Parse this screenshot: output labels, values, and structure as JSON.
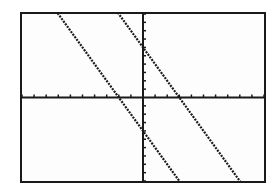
{
  "chart_data": {
    "type": "line",
    "title": "",
    "xlabel": "",
    "ylabel": "",
    "xlim": [
      -10,
      10
    ],
    "ylim": [
      -10,
      10
    ],
    "xscale_tick": 1,
    "yscale_tick": 1,
    "grid": false,
    "axes_visible": true,
    "series": [
      {
        "name": "Y1",
        "equation": "y = -2x + 6",
        "slope": -2,
        "intercept": 6,
        "color": "#1a1a1a"
      },
      {
        "name": "Y2",
        "equation": "y = -2x - 4",
        "slope": -2,
        "intercept": -4,
        "color": "#1a1a1a"
      }
    ]
  },
  "colors": {
    "foreground": "#1a1a1a",
    "background": "#fdfdfd"
  }
}
